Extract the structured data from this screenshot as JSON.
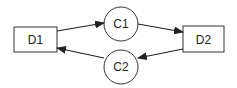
{
  "diagram": {
    "nodes": [
      {
        "id": "D1",
        "label": "D1",
        "shape": "rectangle"
      },
      {
        "id": "C1",
        "label": "C1",
        "shape": "circle"
      },
      {
        "id": "D2",
        "label": "D2",
        "shape": "rectangle"
      },
      {
        "id": "C2",
        "label": "C2",
        "shape": "circle"
      }
    ],
    "edges": [
      {
        "from": "D1",
        "to": "C1"
      },
      {
        "from": "C1",
        "to": "D2"
      },
      {
        "from": "D2",
        "to": "C2"
      },
      {
        "from": "C2",
        "to": "D1"
      }
    ],
    "colors": {
      "stroke": "#222222",
      "background": "#ffffff"
    }
  }
}
